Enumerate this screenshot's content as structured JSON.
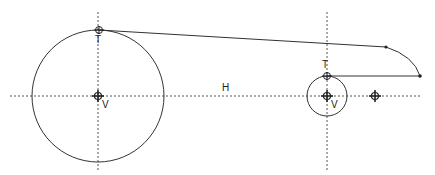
{
  "diagram": {
    "colors": {
      "stroke": "#222222",
      "centerline": "#555555",
      "background": "#ffffff"
    },
    "labels": {
      "large_tangent": "T",
      "large_center": "V",
      "horizontal_axis": "H",
      "small_tangent": "T",
      "small_center": "V"
    },
    "elements": {
      "large_circle": {
        "cx": 98,
        "cy": 96,
        "r": 66
      },
      "small_circle": {
        "cx": 327,
        "cy": 96,
        "r": 20
      },
      "tangent_line": {
        "x1": 99,
        "y1": 30,
        "x2": 386,
        "y2": 47
      },
      "arc_end": {
        "x": 420,
        "y": 76
      },
      "return_line": {
        "x1": 420,
        "y1": 76,
        "x2": 327,
        "y2": 76
      },
      "extra_marker": {
        "x": 375,
        "y": 96
      },
      "horizontal_centerline_y": 96,
      "vertical_centerlines_x": [
        98,
        327
      ]
    }
  }
}
